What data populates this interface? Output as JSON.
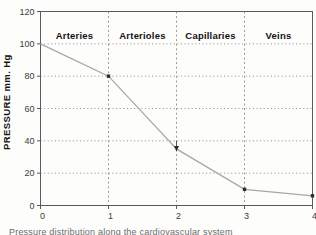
{
  "figure": {
    "caption_fragment": "Pressure distribution along the cardiovascular system"
  },
  "chart_data": {
    "type": "line",
    "title": "",
    "xlabel": "",
    "ylabel": "PRESSURE  mm. Hg",
    "x": [
      0,
      1,
      2,
      3,
      4
    ],
    "series": [
      {
        "name": "Pressure (mm. Hg)",
        "values": [
          100,
          80,
          35,
          10,
          6
        ]
      }
    ],
    "xlim": [
      0,
      4
    ],
    "ylim": [
      0,
      120
    ],
    "x_ticks": [
      "0",
      "1",
      "2",
      "3",
      "4"
    ],
    "y_ticks": [
      "0",
      "20",
      "40",
      "60",
      "80",
      "100",
      "120"
    ],
    "y_gridlines": [
      20,
      40,
      60,
      80,
      100
    ],
    "vertical_separators": [
      1,
      2,
      3
    ],
    "region_labels": [
      {
        "label": "Arteries",
        "from": 0,
        "to": 1
      },
      {
        "label": "Arterioles",
        "from": 1,
        "to": 2
      },
      {
        "label": "Capillaries",
        "from": 2,
        "to": 3
      },
      {
        "label": "Veins",
        "from": 3,
        "to": 4
      }
    ],
    "legend_position": "none",
    "grid": "dotted horizontal gridlines; dashed vertical separators at x=1,2,3",
    "colors": {
      "frame": "#5a5a5a",
      "line": "#a8a8a8",
      "marker": "#2e2e2e",
      "grid": "#8a8a8a",
      "separator": "#9a9a9a",
      "tick_text": "#3c3c3c",
      "region_text": "#141414"
    }
  }
}
